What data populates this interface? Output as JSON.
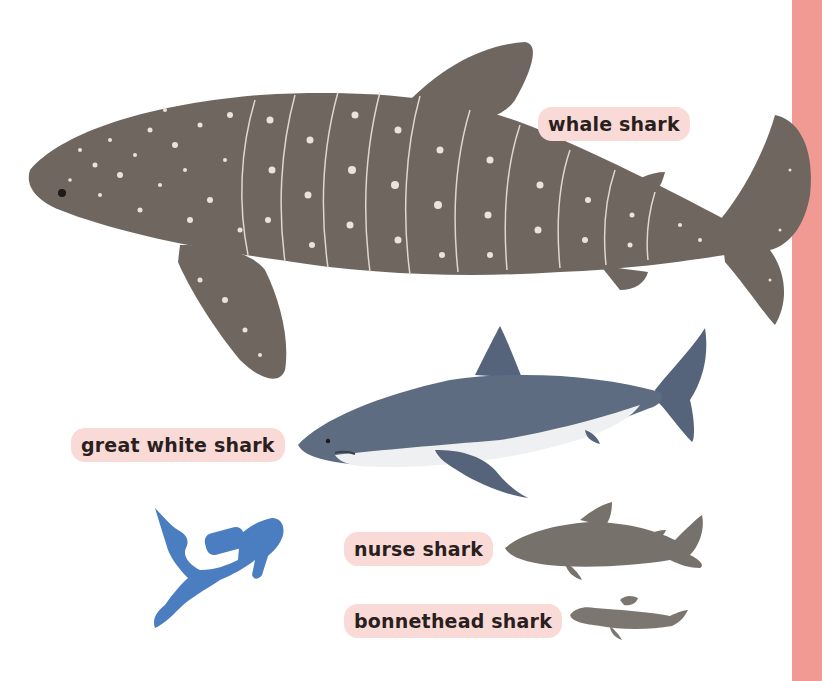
{
  "labels": {
    "whale_shark": "whale shark",
    "great_white_shark": "great white shark",
    "nurse_shark": "nurse shark",
    "bonnethead_shark": "bonnethead shark"
  },
  "colors": {
    "label_bg": "#fadad6",
    "side_strip": "#f19a93",
    "whale_shark": "#6f6660",
    "great_white_top": "#5d6c80",
    "great_white_belly": "#eef0f2",
    "nurse_shark": "#77716b",
    "bonnethead_shark": "#7b7670",
    "diver": "#4a7ec0"
  },
  "figures": [
    "whale-shark",
    "great-white-shark",
    "scuba-diver",
    "nurse-shark",
    "bonnethead-shark"
  ]
}
